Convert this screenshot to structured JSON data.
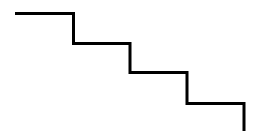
{
  "diagram": {
    "type": "staircase-line",
    "stroke_color": "#000000",
    "background": "#ffffff",
    "stroke_width": 3,
    "points": [
      [
        15,
        13.5
      ],
      [
        73.5,
        13.5
      ],
      [
        73.5,
        43.5
      ],
      [
        130,
        43.5
      ],
      [
        130,
        72.5
      ],
      [
        187,
        72.5
      ],
      [
        187,
        103.5
      ],
      [
        244,
        103.5
      ],
      [
        244,
        131
      ]
    ]
  }
}
